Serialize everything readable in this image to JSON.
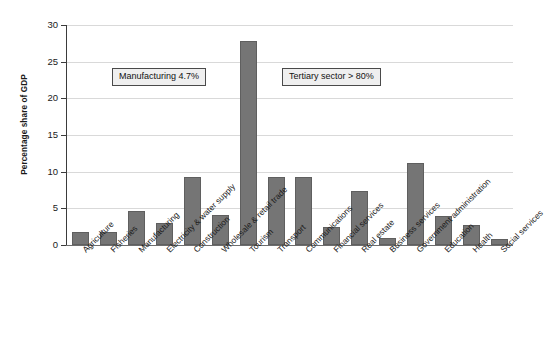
{
  "chart_data": {
    "type": "bar",
    "title": "",
    "xlabel": "",
    "ylabel": "Percentage share of GDP",
    "ylim": [
      0,
      30
    ],
    "yticks": [
      0,
      5,
      10,
      15,
      20,
      25,
      30
    ],
    "grid": true,
    "legend": "none",
    "bar_color": "#757575",
    "categories": [
      "Agriculture",
      "Fisheries",
      "Manufacturing",
      "Electricity & water supply",
      "Construction",
      "Wholesale & retail trade",
      "Tourism",
      "Transport",
      "Communications",
      "Financial services",
      "Real estate",
      "Business services",
      "Government administration",
      "Education",
      "Health",
      "Social services"
    ],
    "values": [
      1.8,
      1.8,
      4.7,
      3.0,
      9.3,
      4.1,
      27.8,
      9.3,
      9.3,
      2.5,
      7.4,
      1.0,
      11.2,
      4.0,
      2.7,
      0.8
    ],
    "annotations": [
      {
        "text": "Manufacturing 4.7%"
      },
      {
        "text": "Tertiary sector > 80%"
      }
    ]
  }
}
